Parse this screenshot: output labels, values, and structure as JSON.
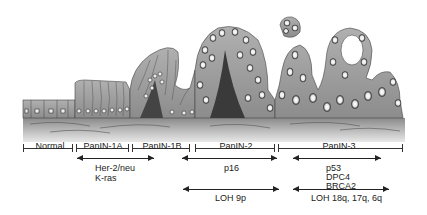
{
  "figure": {
    "colors": {
      "tissue": "#9a9a9a",
      "tissue_dark": "#555555",
      "nucleus": "#f2f2f2",
      "line": "#222222"
    }
  },
  "stages": [
    {
      "label": "Normal"
    },
    {
      "label": "PanIN-1A"
    },
    {
      "label": "PanIN-1B"
    },
    {
      "label": "PanIN-2"
    },
    {
      "label": "PanIN-3"
    }
  ],
  "alterations": {
    "early": {
      "lines": [
        "Her-2/neu",
        "K-ras"
      ]
    },
    "intermediate": {
      "lines": [
        "p16"
      ]
    },
    "late": {
      "lines": [
        "p53",
        "DPC4",
        "BRCA2"
      ]
    },
    "loh_intermediate": {
      "label": "LOH 9p"
    },
    "loh_late": {
      "label": "LOH 18q, 17q, 6q"
    }
  }
}
